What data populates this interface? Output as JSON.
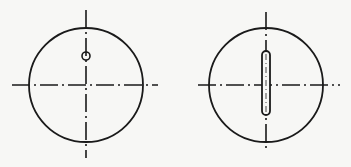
{
  "colors": {
    "background": "#f7f7f5",
    "ink": "#1a1a1a"
  },
  "views": [
    {
      "name": "view-with-hole",
      "circle": {
        "cx": 86,
        "cy": 85,
        "r": 57
      },
      "centerline_v": {
        "x": 86,
        "y1": 10,
        "y2": 158
      },
      "centerline_h": {
        "y": 85,
        "x1": 12,
        "x2": 158
      },
      "feature": {
        "type": "hole",
        "cx": 86,
        "cy": 56,
        "r": 4
      }
    },
    {
      "name": "view-with-slot",
      "circle": {
        "cx": 266,
        "cy": 85,
        "r": 57
      },
      "centerline_v": {
        "x": 266,
        "y1": 12,
        "y2": 152
      },
      "centerline_h": {
        "y": 85,
        "x1": 198,
        "x2": 340
      },
      "feature": {
        "type": "slot",
        "x": 262,
        "y": 51,
        "w": 8,
        "h": 64,
        "rx": 4
      }
    }
  ]
}
